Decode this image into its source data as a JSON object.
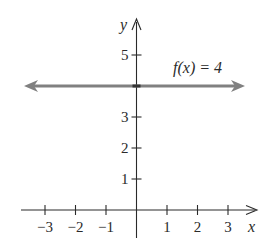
{
  "chart_data": {
    "type": "line",
    "title": "",
    "function_label": "f(x) = 4",
    "xlabel": "x",
    "ylabel": "y",
    "xlim": [
      -3.5,
      4
    ],
    "ylim": [
      0,
      5.5
    ],
    "x_ticks": [
      -3,
      -2,
      -1,
      1,
      2,
      3
    ],
    "x_tick_labels": [
      "−3",
      "−2",
      "−1",
      "1",
      "2",
      "3"
    ],
    "y_ticks": [
      1,
      2,
      3,
      5
    ],
    "y_tick_labels": [
      "1",
      "2",
      "3",
      "5"
    ],
    "grid": false,
    "legend": null,
    "series": [
      {
        "name": "f(x) = 4",
        "x": [
          -3.7,
          3.6
        ],
        "y": [
          4,
          4
        ],
        "color": "#808080",
        "arrows": "both"
      }
    ]
  },
  "colors": {
    "axis": "#2a2a2a",
    "line": "#808080"
  }
}
